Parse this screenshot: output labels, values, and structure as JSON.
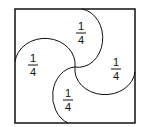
{
  "diagram": {
    "square": {
      "x": 15,
      "y": 9,
      "width": 120,
      "height": 114
    },
    "stroke_color": "#111111",
    "labels": [
      {
        "region": "top",
        "numerator": "1",
        "denominator": "4",
        "x": 81,
        "y": 34
      },
      {
        "region": "left",
        "numerator": "1",
        "denominator": "4",
        "x": 33,
        "y": 65
      },
      {
        "region": "right",
        "numerator": "1",
        "denominator": "4",
        "x": 116,
        "y": 69
      },
      {
        "region": "bottom",
        "numerator": "1",
        "denominator": "4",
        "x": 68,
        "y": 100
      }
    ]
  }
}
